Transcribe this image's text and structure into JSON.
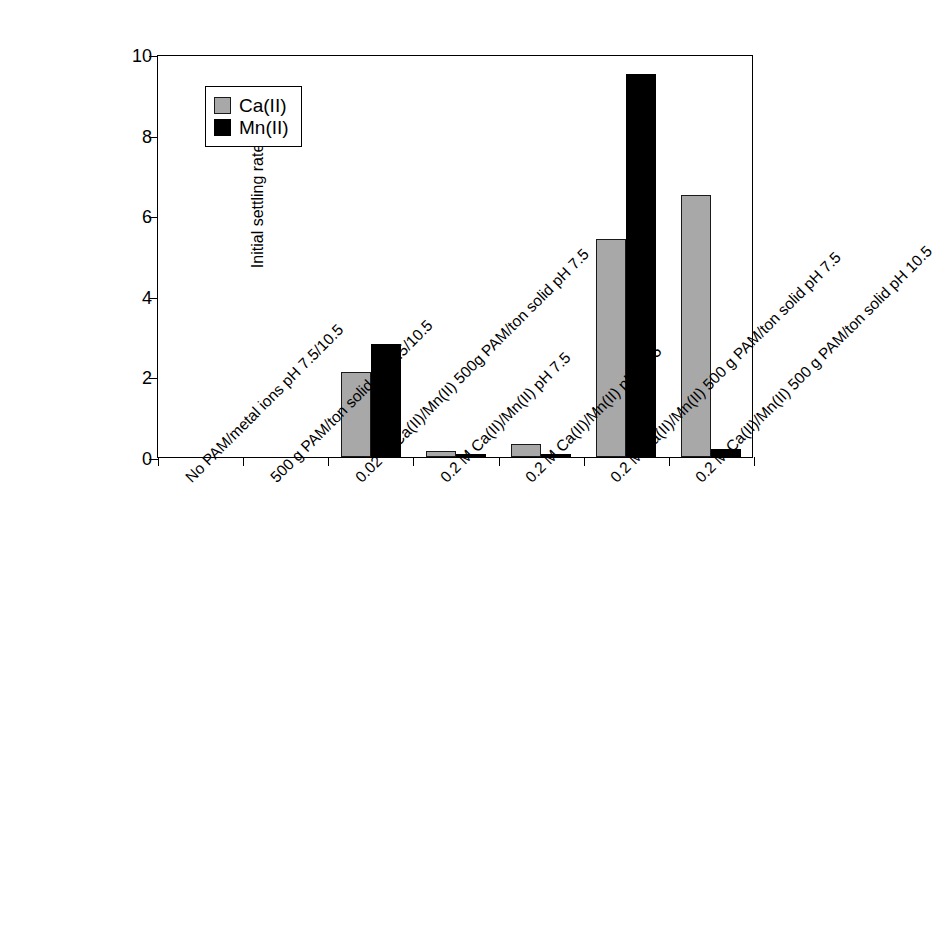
{
  "chart_data": {
    "type": "bar",
    "title": "",
    "xlabel": "",
    "ylabel": "Initial settling rate (m/h)",
    "ylim": [
      0,
      10
    ],
    "yticks": [
      0,
      2,
      4,
      6,
      8,
      10
    ],
    "grid": false,
    "legend_position": "upper left inside",
    "categories": [
      "No PAM/metal ions pH 7.5/10.5",
      "500 g PAM/ton solid pH 7.5/10.5",
      "0.02 M Ca(II)/Mn(II) 500g PAM/ton solid pH 7.5",
      "0.2 M Ca(II)/Mn(II) pH 7.5",
      "0.2 M Ca(II)/Mn(II) pH 10.5",
      "0.2 M Ca(II)/Mn(II) 500 g PAM/ton solid pH 7.5",
      "0.2 M Ca(II)/Mn(II) 500 g PAM/ton solid pH 10.5"
    ],
    "series": [
      {
        "name": "Ca(II)",
        "color": "#a8a8a8",
        "values": [
          0,
          0,
          2.1,
          0.15,
          0.33,
          5.4,
          6.5
        ]
      },
      {
        "name": "Mn(II)",
        "color": "#000000",
        "values": [
          0,
          0,
          2.8,
          0.08,
          0.08,
          9.5,
          0.2
        ]
      }
    ]
  },
  "legend": {
    "entries": [
      {
        "label": "Ca(II)"
      },
      {
        "label": "Mn(II)"
      }
    ]
  },
  "axis": {
    "y_label": "Initial settling rate (m/h)",
    "y_tick_labels": [
      "0",
      "2",
      "4",
      "6",
      "8",
      "10"
    ]
  },
  "colors": {
    "ca": "#a8a8a8",
    "mn": "#000000",
    "axis": "#000000",
    "background": "#ffffff"
  }
}
